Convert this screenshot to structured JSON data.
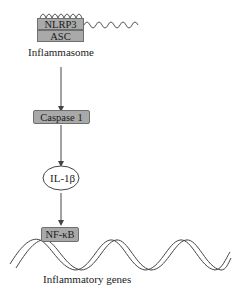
{
  "diagram": {
    "nodes": {
      "nlrp3": "NLRP3",
      "asc": "ASC",
      "inflammasome": "Inflammasome",
      "caspase1": "Caspase 1",
      "il1b": "IL-1β",
      "nfkb": "NF-κB",
      "genes": "Inflammatory genes"
    },
    "edges": [
      {
        "from": "Inflammasome",
        "to": "Caspase 1"
      },
      {
        "from": "Caspase 1",
        "to": "IL-1β"
      },
      {
        "from": "IL-1β",
        "to": "NF-κB"
      }
    ],
    "colors": {
      "box_fill": "#a9a9a9",
      "box_border": "#6f6f6f",
      "line": "#444444"
    }
  }
}
